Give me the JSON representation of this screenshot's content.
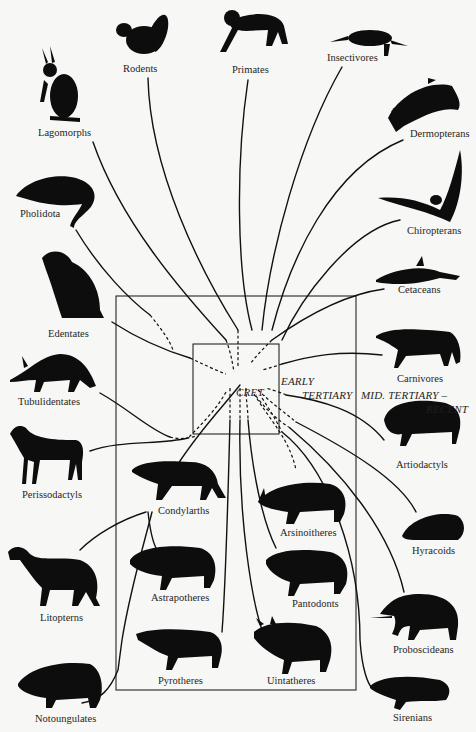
{
  "diagram": {
    "type": "phylogenetic-radiation",
    "eras": {
      "cretaceous": "CRET.",
      "early_tertiary_line1": "EARLY",
      "early_tertiary_line2": "TERTIARY",
      "mid_tertiary_line1": "MID. TERTIARY –",
      "mid_tertiary_line2": "RECENT"
    },
    "orders": {
      "rodents": "Rodents",
      "primates": "Primates",
      "insectivores": "Insectivores",
      "lagomorphs": "Lagomorphs",
      "dermopterans": "Dermopterans",
      "pholidota": "Pholidota",
      "chiropterans": "Chiropterans",
      "edentates": "Edentates",
      "cetaceans": "Cetaceans",
      "carnivores": "Carnivores",
      "tubulidentates": "Tubulidentates",
      "artiodactyls": "Artiodactyls",
      "perissodactyls": "Perissodactyls",
      "condylarths": "Condylarths",
      "arsinoitheres": "Arsinoitheres",
      "hyracoids": "Hyracoids",
      "litopterns": "Litopterns",
      "astrapotheres": "Astrapotheres",
      "pantodonts": "Pantodonts",
      "proboscideans": "Proboscideans",
      "pyrotheres": "Pyrotheres",
      "uintatheres": "Uintatheres",
      "notoungulates": "Notoungulates",
      "sirenians": "Sirenians"
    },
    "colors": {
      "ink": "#111111",
      "background": "#f7f7f5"
    }
  }
}
